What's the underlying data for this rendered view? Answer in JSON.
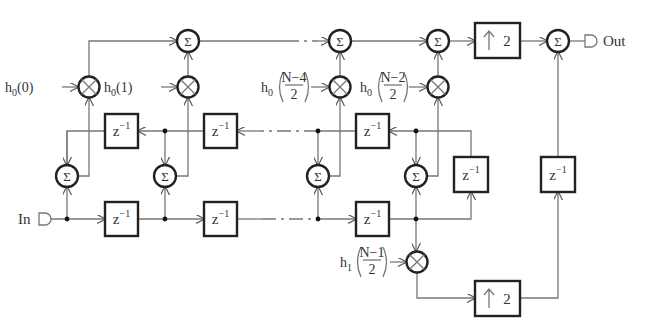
{
  "labels": {
    "input": "In",
    "output": "Out",
    "sigma": "Σ",
    "delay_base": "z",
    "delay_exp": "−1",
    "upsample_arrow": "↑",
    "upsample_factor": "2"
  },
  "coefficients": {
    "c0": {
      "base": "h",
      "sub": "0",
      "arg": "(0)"
    },
    "c1": {
      "base": "h",
      "sub": "0",
      "arg": "(1)"
    },
    "c2": {
      "base": "h",
      "sub": "0",
      "num": "N−4",
      "den": "2"
    },
    "c3": {
      "base": "h",
      "sub": "0",
      "num": "N−2",
      "den": "2"
    },
    "c4": {
      "base": "h",
      "sub": "1",
      "num": "N−1",
      "den": "2"
    }
  },
  "colors": {
    "wire": "#777777",
    "block_border": "#222222",
    "text": "#333333"
  }
}
